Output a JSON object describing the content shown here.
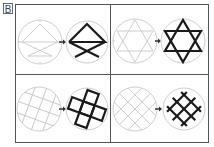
{
  "label": "B",
  "colors": {
    "frame": "#555555",
    "guide": "#c8c8c8",
    "bold": "#1a1a1a",
    "arrow": "#333333"
  },
  "panels": [
    {
      "id": "1",
      "description": "triangle with crossed lines below; guide circle with faint construction lines -> bold figure"
    },
    {
      "id": "2",
      "description": "six-pointed star (hexagram) constructed from guide lines -> bold hexagram"
    },
    {
      "id": "3",
      "description": "tilted square grid -> bold cross of five tilted squares"
    },
    {
      "id": "4",
      "description": "diagonal 45° grid -> bold diamond lattice"
    }
  ]
}
